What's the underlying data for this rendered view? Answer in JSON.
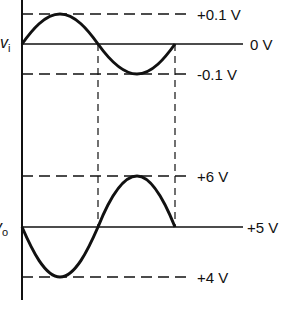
{
  "diagram": {
    "type": "waveform",
    "input": {
      "signal_label": "v",
      "signal_sub": "i",
      "levels": [
        {
          "name": "max",
          "label": "+0.1 V",
          "style": "dashed"
        },
        {
          "name": "baseline",
          "label": "0 V",
          "style": "solid"
        },
        {
          "name": "min",
          "label": "-0.1 V",
          "style": "dashed"
        }
      ]
    },
    "output": {
      "signal_label": "v",
      "signal_sub": "o",
      "levels": [
        {
          "name": "max",
          "label": "+6 V",
          "style": "dashed"
        },
        {
          "name": "baseline",
          "label": "+5 V",
          "style": "solid"
        },
        {
          "name": "min",
          "label": "+4 V",
          "style": "dashed"
        }
      ]
    },
    "colors": {
      "ink": "#111111",
      "background": "#ffffff"
    }
  }
}
